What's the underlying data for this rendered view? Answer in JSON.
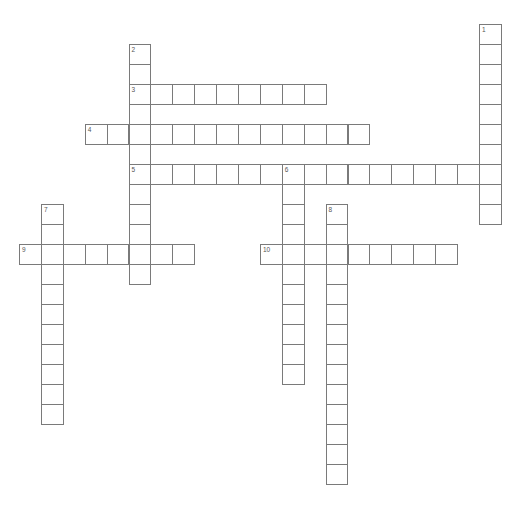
{
  "header": {
    "title": ""
  },
  "grid": {
    "origin_x": 19,
    "origin_y": 24,
    "cell_w": 21.9,
    "cell_h": 20,
    "border_color": "#7a7a7a"
  },
  "words": [
    {
      "number": "1",
      "direction": "down",
      "col": 21,
      "row": 0,
      "length": 10
    },
    {
      "number": "2",
      "direction": "down",
      "col": 5,
      "row": 1,
      "length": 12
    },
    {
      "number": "3",
      "direction": "across",
      "col": 5,
      "row": 3,
      "length": 9
    },
    {
      "number": "4",
      "direction": "across",
      "col": 3,
      "row": 5,
      "length": 13
    },
    {
      "number": "5",
      "direction": "across",
      "col": 5,
      "row": 7,
      "length": 17
    },
    {
      "number": "6",
      "direction": "down",
      "col": 12,
      "row": 7,
      "length": 11
    },
    {
      "number": "7",
      "direction": "down",
      "col": 1,
      "row": 9,
      "length": 11
    },
    {
      "number": "8",
      "direction": "down",
      "col": 14,
      "row": 9,
      "length": 14
    },
    {
      "number": "9",
      "direction": "across",
      "col": 0,
      "row": 11,
      "length": 8
    },
    {
      "number": "10",
      "direction": "across",
      "col": 11,
      "row": 11,
      "length": 9
    }
  ]
}
